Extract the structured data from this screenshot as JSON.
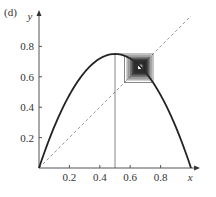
{
  "panel_label": "(d)",
  "chart_data": {
    "type": "line",
    "title": "",
    "panel": "(d)",
    "xlabel": "x",
    "ylabel": "y",
    "xlim": [
      0,
      1
    ],
    "ylim": [
      0,
      1
    ],
    "grid": false,
    "xticks": [
      0.2,
      0.4,
      0.6,
      0.8
    ],
    "xtick_labels": [
      "0.2",
      "0.4",
      "0.6",
      "0.8"
    ],
    "yticks": [
      0.2,
      0.4,
      0.6,
      0.8
    ],
    "ytick_labels": [
      "0.2",
      "0.4",
      "0.6",
      "0.8"
    ],
    "series": [
      {
        "name": "logistic map f(x)=3x(1-x)",
        "style": "solid",
        "color": "#222222",
        "x": [
          0,
          0.1,
          0.2,
          0.3,
          0.4,
          0.5,
          0.6,
          0.7,
          0.8,
          0.9,
          1.0
        ],
        "y": [
          0,
          0.27,
          0.48,
          0.63,
          0.72,
          0.75,
          0.72,
          0.63,
          0.48,
          0.27,
          0
        ]
      },
      {
        "name": "y = x",
        "style": "dashed",
        "color": "#999999",
        "x": [
          0,
          1
        ],
        "y": [
          0,
          1
        ]
      },
      {
        "name": "cobweb iteration",
        "style": "solid",
        "color": "#333333",
        "start_x": 0.5,
        "r": 3.0,
        "fixed_point": 0.667
      }
    ],
    "annotations": [
      "vertical line from x=0.5 to curve",
      "cobweb converging to fixed point near (0.667, 0.667)"
    ]
  }
}
